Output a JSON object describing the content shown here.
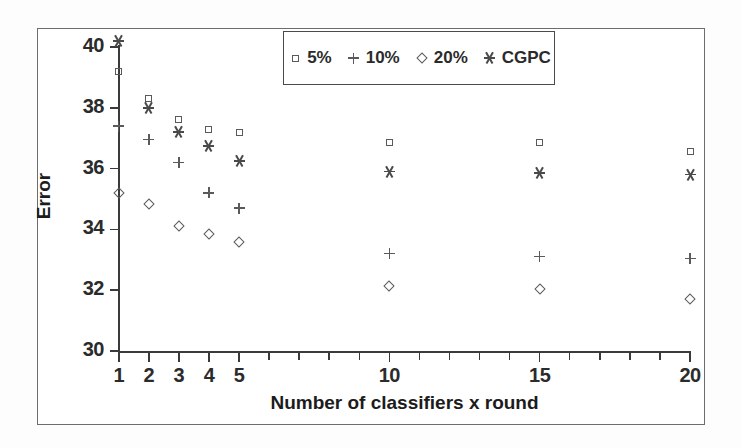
{
  "chart_data": {
    "type": "scatter",
    "title": "",
    "xlabel": "Number of classifiers x round",
    "ylabel": "Error",
    "xlim": [
      1,
      20
    ],
    "ylim": [
      30,
      40
    ],
    "ytick_values": [
      30,
      32,
      34,
      36,
      38,
      40
    ],
    "ytick_labels": [
      "30",
      "32",
      "34",
      "36",
      "38",
      "40"
    ],
    "xtick_values": [
      1,
      2,
      3,
      4,
      5,
      6,
      7,
      8,
      9,
      10,
      11,
      12,
      13,
      14,
      15,
      16,
      17,
      18,
      19,
      20
    ],
    "xtick_labeled": [
      1,
      2,
      3,
      4,
      5,
      10,
      15,
      20
    ],
    "xtick_labels": [
      "1",
      "2",
      "3",
      "4",
      "5",
      "10",
      "15",
      "20"
    ],
    "grid": false,
    "legend_position": "top-center",
    "x": [
      1,
      2,
      3,
      4,
      5,
      10,
      15,
      20
    ],
    "series": [
      {
        "name": "5%",
        "marker": "square",
        "color": "#5a5a5a",
        "values": [
          39.2,
          38.3,
          37.6,
          37.3,
          37.2,
          36.85,
          36.85,
          36.55
        ]
      },
      {
        "name": "10%",
        "marker": "plus",
        "color": "#5a5a5a",
        "values": [
          37.4,
          36.95,
          36.2,
          35.2,
          34.7,
          33.2,
          33.1,
          33.05
        ]
      },
      {
        "name": "20%",
        "marker": "diamond",
        "color": "#5a5a5a",
        "values": [
          35.2,
          34.85,
          34.1,
          33.85,
          33.6,
          32.15,
          32.05,
          31.7
        ]
      },
      {
        "name": "CGPC",
        "marker": "star",
        "color": "#4a4a4a",
        "values": [
          40.2,
          38.0,
          37.2,
          36.75,
          36.25,
          35.9,
          35.85,
          35.8
        ]
      }
    ]
  },
  "legend": {
    "entries": [
      {
        "label": "5%",
        "marker": "square"
      },
      {
        "label": "10%",
        "marker": "plus"
      },
      {
        "label": "20%",
        "marker": "diamond"
      },
      {
        "label": "CGPC",
        "marker": "star"
      }
    ]
  },
  "colors": {
    "frame": "#6d6d6d",
    "axis": "#3a3a3a",
    "text": "#2b2b2b",
    "marker": "#5a5a5a",
    "background": "#ffffff"
  }
}
